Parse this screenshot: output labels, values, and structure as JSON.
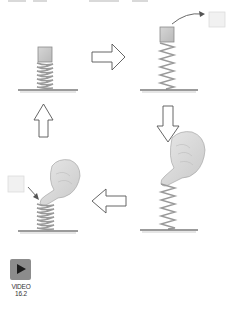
{
  "figure": {
    "type": "spring-energy-cycle",
    "panels": [
      {
        "position": "top-left",
        "description": "block resting on compressed spring",
        "spring_state": "slightly-compressed"
      },
      {
        "position": "top-right",
        "description": "block launched off extended spring",
        "spring_state": "extended",
        "block_motion": "launched-up-right"
      },
      {
        "position": "bottom-right",
        "description": "finger pressing down on spring",
        "spring_state": "extended",
        "hand": true
      },
      {
        "position": "bottom-left",
        "description": "finger compressing spring, block placed on top",
        "spring_state": "compressed",
        "hand": true
      }
    ],
    "arrows": [
      {
        "direction": "right",
        "from": "top-left",
        "to": "top-right"
      },
      {
        "direction": "down",
        "from": "top-right",
        "to": "bottom-right"
      },
      {
        "direction": "left",
        "from": "bottom-right",
        "to": "bottom-left"
      },
      {
        "direction": "up",
        "from": "bottom-left",
        "to": "top-left"
      }
    ],
    "colors": {
      "block": "#c8c8c8",
      "block_ghost": "#eeeeee",
      "spring": "#9a9a9a",
      "ground": "#7a7a7a",
      "arrow_outline": "#555555"
    }
  },
  "video": {
    "icon": "play-icon",
    "label_line1": "VIDEO",
    "label_line2": "16.2"
  }
}
